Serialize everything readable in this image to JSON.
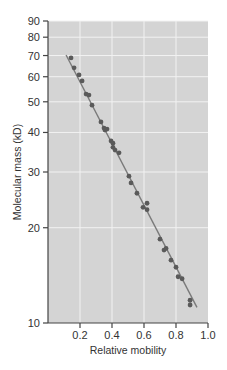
{
  "chart_data": {
    "type": "scatter",
    "title": "",
    "xlabel": "Relative mobility",
    "ylabel": "Molecular mass (kD)",
    "xlim": [
      0,
      1.0
    ],
    "ylim": [
      10,
      90
    ],
    "yscale": "log",
    "grid": true,
    "legend": null,
    "x_ticks": [
      0.2,
      0.4,
      0.6,
      0.8,
      1.0
    ],
    "x_tick_labels": [
      "0.2",
      "0.4",
      "0.6",
      "0.8",
      "1.0"
    ],
    "y_ticks": [
      10,
      20,
      30,
      40,
      50,
      60,
      70,
      80,
      90
    ],
    "y_tick_labels": [
      "10",
      "20",
      "30",
      "40",
      "50",
      "60",
      "70",
      "80",
      "90"
    ],
    "series": [
      {
        "name": "proteins",
        "kind": "scatter",
        "x": [
          0.144,
          0.163,
          0.194,
          0.213,
          0.238,
          0.256,
          0.275,
          0.331,
          0.35,
          0.356,
          0.369,
          0.394,
          0.406,
          0.406,
          0.419,
          0.444,
          0.506,
          0.519,
          0.556,
          0.619,
          0.594,
          0.619,
          0.7,
          0.725,
          0.738,
          0.769,
          0.8,
          0.813,
          0.838,
          0.888,
          0.888
        ],
        "y": [
          68.8,
          64.0,
          60.8,
          58.2,
          52.9,
          52.5,
          48.8,
          43.2,
          41.3,
          40.7,
          41.0,
          37.6,
          37.0,
          35.9,
          35.2,
          34.5,
          29.1,
          27.7,
          25.7,
          23.9,
          23.2,
          22.8,
          18.4,
          17.0,
          17.2,
          15.8,
          15.0,
          14.0,
          13.8,
          11.8,
          11.4
        ]
      },
      {
        "name": "fit line",
        "kind": "line",
        "x": [
          0.113,
          0.931
        ],
        "y": [
          70.3,
          11.2
        ]
      }
    ],
    "colors": {
      "plot_background": "#d4d4d4",
      "grid": "#f2f2f2",
      "points": "#5a5a5a",
      "line": "#7a7a7a",
      "axis": "#444444"
    }
  }
}
